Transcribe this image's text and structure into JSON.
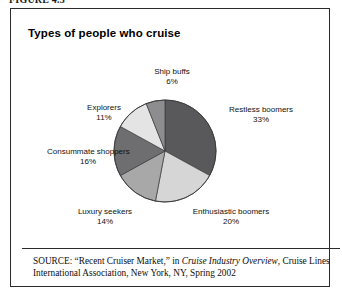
{
  "figure": {
    "label": "FIGURE 4.3",
    "panel_title": "Types of people who cruise"
  },
  "source": {
    "keyword": "SOURCE:",
    "part1": " “Recent Cruiser Market,” in ",
    "italic_title": "Cruise Industry Overview",
    "part2": ", Cruise Lines International Association, New York, NY, Spring 2002"
  },
  "chart_data": {
    "type": "pie",
    "title": "Types of people who cruise",
    "xlabel": "",
    "ylabel": "",
    "units": "percent",
    "start_angle_deg": 0,
    "direction": "clockwise",
    "legend": "none-labels-outside",
    "categories": [
      "Restless boomers",
      "Enthusiastic boomers",
      "Luxury seekers",
      "Consummate shoppers",
      "Explorers",
      "Ship buffs"
    ],
    "values": [
      33,
      20,
      14,
      16,
      11,
      6
    ],
    "total": 100,
    "slices": [
      {
        "label": "Restless boomers",
        "value": 33,
        "value_text": "33%",
        "color": "#59595b"
      },
      {
        "label": "Enthusiastic boomers",
        "value": 20,
        "value_text": "20%",
        "color": "#d6d6d6"
      },
      {
        "label": "Luxury seekers",
        "value": 14,
        "value_text": "14%",
        "color": "#a8a8a8"
      },
      {
        "label": "Consummate shoppers",
        "value": 16,
        "value_text": "16%",
        "color": "#6e6e70"
      },
      {
        "label": "Explorers",
        "value": 11,
        "value_text": "11%",
        "color": "#e4e4e4"
      },
      {
        "label": "Ship buffs",
        "value": 6,
        "value_text": "6%",
        "color": "#8d8d8f"
      }
    ]
  },
  "colors": {
    "frame": "#2b2b2b",
    "background": "#ffffff",
    "text": "#111111",
    "slice_outline": "#3a3a3a"
  }
}
